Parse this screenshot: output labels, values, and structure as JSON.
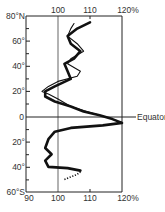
{
  "chart_data": {
    "type": "line",
    "title": "",
    "xlabel": "",
    "ylabel": "Latitude",
    "x_unit": "%",
    "xlim": [
      90,
      120
    ],
    "ylim": [
      -60,
      80
    ],
    "x_ticks": [
      "90",
      "100",
      "110",
      "120%"
    ],
    "x_ticks_top": [
      "100",
      "110",
      "120%"
    ],
    "y_ticks": [
      "80°N",
      "60°",
      "40°",
      "20°",
      "0",
      "20°",
      "40°",
      "60°S"
    ],
    "annotations": [
      {
        "text": "Equator",
        "lat": 0
      }
    ],
    "reference_lines": [
      {
        "x": 100,
        "orientation": "vertical"
      },
      {
        "y": 0,
        "orientation": "horizontal"
      }
    ],
    "grid": false,
    "series": [
      {
        "name": "thick curve",
        "style": "thick solid",
        "points": [
          [
            110,
            75
          ],
          [
            106,
            70
          ],
          [
            103,
            64
          ],
          [
            104,
            58
          ],
          [
            107,
            52
          ],
          [
            105,
            46
          ],
          [
            102,
            42
          ],
          [
            103,
            36
          ],
          [
            104,
            30
          ],
          [
            99,
            24
          ],
          [
            96,
            20
          ],
          [
            96,
            16
          ],
          [
            99,
            12
          ],
          [
            104,
            8
          ],
          [
            108,
            4
          ],
          [
            113,
            1
          ],
          [
            117,
            -2
          ],
          [
            120,
            -5
          ],
          [
            114,
            -7
          ],
          [
            104,
            -9
          ],
          [
            99,
            -12
          ],
          [
            97,
            -18
          ],
          [
            96,
            -25
          ],
          [
            98,
            -30
          ],
          [
            96,
            -35
          ],
          [
            97,
            -40
          ],
          [
            103,
            -41
          ],
          [
            107,
            -43
          ]
        ]
      },
      {
        "name": "thin curve",
        "style": "thin solid",
        "points": [
          [
            105,
            74
          ],
          [
            104,
            70
          ],
          [
            103,
            64
          ],
          [
            106,
            58
          ],
          [
            108,
            52
          ],
          [
            104,
            46
          ],
          [
            103,
            42
          ],
          [
            107,
            36
          ],
          [
            106,
            32
          ],
          [
            100,
            28
          ],
          [
            97,
            24
          ],
          [
            95,
            20
          ],
          [
            97,
            18
          ],
          [
            100,
            14
          ],
          [
            104,
            8
          ],
          [
            109,
            4
          ],
          [
            113,
            1
          ]
        ]
      },
      {
        "name": "dotted segment",
        "style": "dotted",
        "points": [
          [
            102,
            -50
          ],
          [
            104,
            -48
          ],
          [
            106,
            -46
          ],
          [
            107,
            -44
          ]
        ]
      }
    ]
  },
  "labels": {
    "top": [
      "100",
      "110",
      "120%"
    ],
    "bottom": [
      "90",
      "100",
      "110",
      "120%"
    ],
    "left": [
      "80°N",
      "60°",
      "40°",
      "20°",
      "0",
      "40°",
      "60°S"
    ],
    "left_20s": "20°",
    "equator": "Equator"
  }
}
